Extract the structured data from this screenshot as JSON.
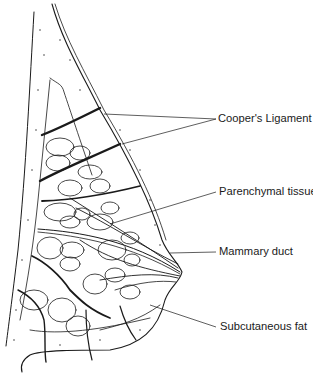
{
  "figure": {
    "ink_color": "#1a1a1a",
    "background": "#ffffff"
  },
  "labels": [
    {
      "id": "coopers-ligament",
      "text": "Cooper's Ligament",
      "x": 218,
      "y": 111,
      "leaders": [
        [
          104,
          114,
          216,
          119
        ],
        [
          122,
          144,
          216,
          119
        ]
      ]
    },
    {
      "id": "parenchymal-tissue",
      "text": "Parenchymal tissue",
      "x": 219,
      "y": 187,
      "leaders": [
        [
          110,
          224,
          216,
          192
        ]
      ]
    },
    {
      "id": "mammary-duct",
      "text": "Mammary duct",
      "x": 219,
      "y": 247,
      "leaders": [
        [
          170,
          253,
          216,
          252
        ]
      ]
    },
    {
      "id": "subcutaneous-fat",
      "text": "Subcutaneous fat",
      "x": 220,
      "y": 322,
      "leaders": [
        [
          150,
          305,
          216,
          327
        ]
      ]
    }
  ]
}
